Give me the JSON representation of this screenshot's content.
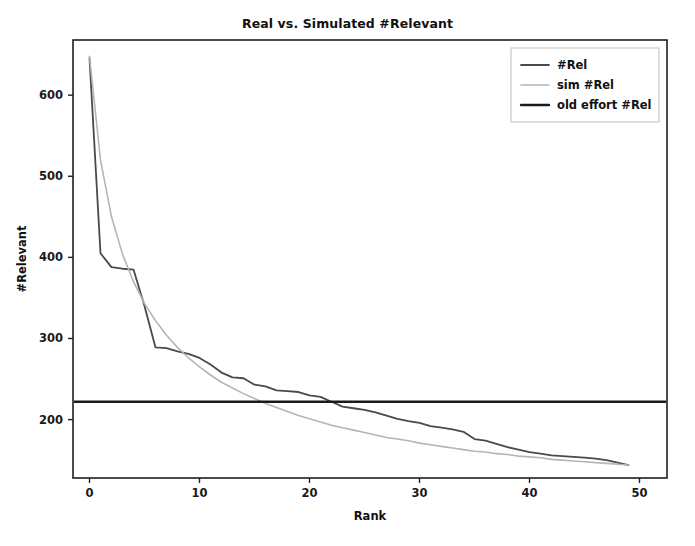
{
  "chart_data": {
    "type": "line",
    "title": "Real vs. Simulated #Relevant",
    "xlabel": "Rank",
    "ylabel": "#Relevant",
    "xlim": [
      -1.5,
      52.5
    ],
    "ylim": [
      128,
      668
    ],
    "xticks": [
      0,
      10,
      20,
      30,
      40,
      50
    ],
    "xtick_labels": [
      "0",
      "10",
      "20",
      "30",
      "40",
      "50"
    ],
    "yticks": [
      200,
      300,
      400,
      500,
      600
    ],
    "ytick_labels": [
      "200",
      "300",
      "400",
      "500",
      "600"
    ],
    "grid": false,
    "legend_position": "upper right",
    "x": [
      0,
      1,
      2,
      3,
      4,
      5,
      6,
      7,
      8,
      9,
      10,
      11,
      12,
      13,
      14,
      15,
      16,
      17,
      18,
      19,
      20,
      21,
      22,
      23,
      24,
      25,
      26,
      27,
      28,
      29,
      30,
      31,
      32,
      33,
      34,
      35,
      36,
      37,
      38,
      39,
      40,
      41,
      42,
      43,
      44,
      45,
      46,
      47,
      48,
      49
    ],
    "series": [
      {
        "name": "#Rel",
        "color": "#4a4a4a",
        "linewidth": 1.8,
        "values": [
          646,
          405,
          388,
          386,
          385,
          340,
          289,
          288,
          284,
          281,
          276,
          268,
          258,
          252,
          251,
          243,
          241,
          236,
          235,
          234,
          230,
          228,
          222,
          216,
          214,
          212,
          209,
          205,
          201,
          198,
          196,
          192,
          190,
          188,
          185,
          176,
          174,
          170,
          166,
          163,
          160,
          158,
          156,
          155,
          154,
          153,
          152,
          150,
          147,
          144
        ]
      },
      {
        "name": "sim #Rel",
        "color": "#b5b5b5",
        "linewidth": 1.6,
        "values": [
          648,
          520,
          450,
          404,
          370,
          343,
          322,
          304,
          289,
          276,
          265,
          255,
          246,
          239,
          232,
          226,
          220,
          215,
          210,
          205,
          201,
          197,
          193,
          190,
          187,
          184,
          181,
          178,
          176,
          174,
          171,
          169,
          167,
          165,
          163,
          161,
          160,
          158,
          157,
          155,
          154,
          153,
          151,
          150,
          149,
          148,
          147,
          146,
          145,
          144
        ]
      }
    ],
    "hline": {
      "name": "old effort #Rel",
      "color": "#1a1a1a",
      "linewidth": 2.4,
      "value": 222
    },
    "legend_entries": [
      {
        "label": "#Rel",
        "color": "#4a4a4a",
        "linewidth": 1.8
      },
      {
        "label": "sim #Rel",
        "color": "#b5b5b5",
        "linewidth": 1.6
      },
      {
        "label": "old effort #Rel",
        "color": "#1a1a1a",
        "linewidth": 2.4
      }
    ]
  }
}
